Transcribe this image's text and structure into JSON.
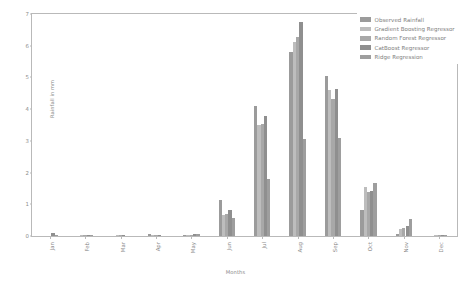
{
  "chart_data": {
    "type": "bar",
    "title": "",
    "xlabel": "Months",
    "ylabel": "Rainfall in mm",
    "categories": [
      "Jan",
      "Feb",
      "Mar",
      "Apr",
      "May",
      "Jun",
      "Jul",
      "Aug",
      "Sep",
      "Oct",
      "Nov",
      "Dec"
    ],
    "ylim": [
      0,
      7
    ],
    "yticks": [
      0,
      1,
      2,
      3,
      4,
      5,
      6,
      7
    ],
    "ytick_labels": [
      "0",
      "1",
      "2",
      "3",
      "4",
      "5",
      "6",
      "7"
    ],
    "grid": false,
    "legend_position": "upper right",
    "series": [
      {
        "name": "Observed Rainfall",
        "color": "#9b9b9b",
        "values": [
          0.0,
          0.0,
          0.0,
          0.06,
          0.03,
          1.15,
          4.1,
          5.8,
          5.05,
          0.82,
          0.05,
          0.0
        ]
      },
      {
        "name": "Gradient Boosting Regressor",
        "color": "#bdbdbd",
        "values": [
          0.0,
          0.01,
          0.01,
          0.02,
          0.03,
          0.66,
          3.5,
          6.12,
          4.6,
          1.55,
          0.22,
          0.02
        ]
      },
      {
        "name": "Random Forest Regressor",
        "color": "#a8a8a8",
        "values": [
          0.0,
          0.02,
          0.02,
          0.02,
          0.04,
          0.7,
          3.52,
          6.28,
          4.33,
          1.38,
          0.26,
          0.03
        ]
      },
      {
        "name": "CatBoost Regressor",
        "color": "#8f8f8f",
        "values": [
          0.1,
          0.03,
          0.02,
          0.02,
          0.05,
          0.83,
          3.8,
          6.75,
          4.65,
          1.42,
          0.33,
          0.04
        ]
      },
      {
        "name": "Ridge Regression",
        "color": "#9e9e9e",
        "values": [
          0.01,
          0.01,
          0.0,
          0.0,
          0.05,
          0.57,
          1.8,
          3.05,
          3.08,
          1.67,
          0.55,
          0.01
        ]
      }
    ]
  },
  "axes": {
    "frame_color": "#b9b9b9",
    "tick_color": "#8c8c8c"
  }
}
